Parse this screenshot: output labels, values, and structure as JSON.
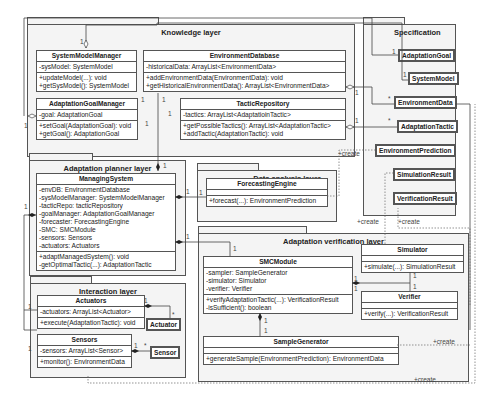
{
  "packages": {
    "knowledge": {
      "title": "Knowledge layer"
    },
    "specification": {
      "title": "Specification"
    },
    "planner": {
      "title": "Adaptation planner layer"
    },
    "data_analysis": {
      "title": "Data analysis layer"
    },
    "verification": {
      "title": "Adaptation verification layer"
    },
    "interaction": {
      "title": "Interaction layer"
    }
  },
  "classes": {
    "system_model_manager": {
      "name": "SystemModelManager",
      "attributes": [
        "-sysModel: SystemModel"
      ],
      "methods": [
        "+updateModel(...): void",
        "+getSysModel(): SystemModel"
      ]
    },
    "environment_database": {
      "name": "EnvironmentDatabase",
      "attributes": [
        "-historicalData: ArrayList<EnvironmentData>"
      ],
      "methods": [
        "+addEnvironmentData(EnvironmentData): void",
        "+getHistoricalEnvironmentData(): ArrayList<EnvironmentData>"
      ]
    },
    "adaptation_goal_manager": {
      "name": "AdaptationGoalManager",
      "attributes": [
        "-goal: AdaptationGoal"
      ],
      "methods": [
        "+setGoal(AdaptationGoal): void",
        "+getGoal(): AdaptationGoal"
      ]
    },
    "tactic_repository": {
      "name": "TacticRepository",
      "attributes": [
        "-tactics: ArrayList<AdaptatioinTactic>"
      ],
      "methods": [
        "+getPossibleTactics(): ArrayList<AdaptationTactic>",
        "+addTactic(AdaptationTactic): void"
      ]
    },
    "managing_system": {
      "name": "ManagingSystem",
      "attributes": [
        "-envDB: EnvironmentDatabase",
        "-sysModelManager: SystemModelManager",
        "-tacticRepo: tacticRepository",
        "-goalManager: AdaptationGoalManager",
        "-forecaster: ForecastingEngine",
        "-SMC: SMCModule",
        "-sensors: Sensors",
        "-actuators: Actuators"
      ],
      "methods": [
        "+adaptManagedSystem(): void",
        "-getOptimalTactic(...): AdaptationTactic"
      ]
    },
    "forecasting_engine": {
      "name": "ForecastingEngine",
      "attributes": [],
      "methods": [
        "+forecast(...): EnvironmentPrediction"
      ]
    },
    "smc_module": {
      "name": "SMCModule",
      "attributes": [
        "-sampler: SampleGenerator",
        "-simulator: Simulator",
        "-verifier: Verifier"
      ],
      "methods": [
        "+verifyAdaptationTactic(...): VerificationResult",
        "-isSufficient(): boolean"
      ]
    },
    "simulator": {
      "name": "Simulator",
      "methods": [
        "+simulate(...): SimulationResult"
      ]
    },
    "verifier": {
      "name": "Verifier",
      "methods": [
        "+verify(...): VerificationResult"
      ]
    },
    "sample_generator": {
      "name": "SampleGenerator",
      "methods": [
        "+generateSample(EnvironmentPrediction): EnvironmentData"
      ]
    },
    "actuators": {
      "name": "Actuators",
      "attributes": [
        "-actuators: ArrayList<Actuator>"
      ],
      "methods": [
        "+execute(AdaptationTactic): void"
      ]
    },
    "sensors": {
      "name": "Sensors",
      "attributes": [
        "-sensors: ArrayList<Sensor>"
      ],
      "methods": [
        "+monitor(): EnvironmentData"
      ]
    }
  },
  "spec_classes": [
    "AdaptationGoal",
    "SystemModel",
    "EnvironmentData",
    "AdaptationTactic",
    "EnvironmentPrediction",
    "SimulationResult",
    "VerificationResult"
  ],
  "leaf_classes": {
    "actuator": "Actuator",
    "sensor": "Sensor"
  },
  "labels": {
    "one": "1",
    "many": "*",
    "create": "+create"
  }
}
